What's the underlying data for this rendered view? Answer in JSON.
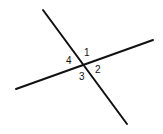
{
  "diagram": {
    "lines": [
      {
        "name": "line-a",
        "x1": 43,
        "y1": 10,
        "x2": 127,
        "y2": 124
      },
      {
        "name": "line-b",
        "x1": 16,
        "y1": 89,
        "x2": 153,
        "y2": 40
      }
    ],
    "stroke_color": "#111111",
    "angle_labels": [
      {
        "label": "1",
        "x": 84,
        "y": 56
      },
      {
        "label": "2",
        "x": 95,
        "y": 73
      },
      {
        "label": "3",
        "x": 79,
        "y": 80
      },
      {
        "label": "4",
        "x": 66,
        "y": 64
      }
    ]
  }
}
